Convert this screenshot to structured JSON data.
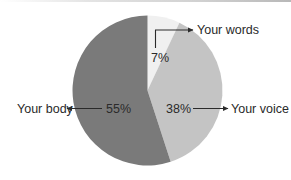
{
  "chart_data": {
    "type": "pie",
    "title": "",
    "start_angle_deg": 0,
    "direction": "clockwise",
    "slices": [
      {
        "label": "Your words",
        "value": 7,
        "value_label": "7%",
        "color": "#f0f0f0"
      },
      {
        "label": "Your voice",
        "value": 38,
        "value_label": "38%",
        "color": "#c4c4c4"
      },
      {
        "label": "Your body",
        "value": 55,
        "value_label": "55%",
        "color": "#7a7a7a"
      }
    ],
    "categories": [
      "Your words",
      "Your voice",
      "Your body"
    ],
    "values": [
      7,
      38,
      55
    ],
    "legend": "none (callout labels with arrows)"
  },
  "labels": {
    "words": "Your words",
    "voice": "Your voice",
    "body": "Your body",
    "words_pct": "7%",
    "voice_pct": "38%",
    "body_pct": "55%"
  },
  "colors": {
    "body": "#7a7a7a",
    "voice": "#c4c4c4",
    "words": "#f0f0f0",
    "text": "#2a2a2a",
    "arrow": "#2a2a2a"
  }
}
